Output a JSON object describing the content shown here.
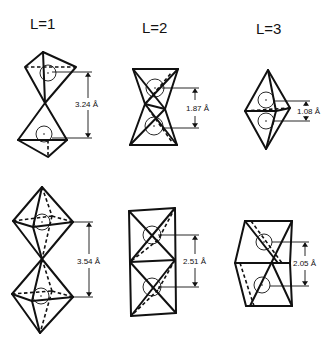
{
  "columns": [
    {
      "label": "L=1",
      "top_distance": "3.24 Å",
      "bottom_distance": "3.54 Å",
      "top_shape": "corner-sharing tetrahedra",
      "bottom_shape": "corner-sharing octahedra"
    },
    {
      "label": "L=2",
      "top_distance": "1.87 Å",
      "bottom_distance": "2.51 Å",
      "top_shape": "edge-sharing tetrahedra",
      "bottom_shape": "edge-sharing octahedra"
    },
    {
      "label": "L=3",
      "top_distance": "1.08 Å",
      "bottom_distance": "2.05 Å",
      "top_shape": "face-sharing tetrahedra",
      "bottom_shape": "face-sharing octahedra"
    }
  ],
  "colors": {
    "ink": "#111111",
    "background": "#ffffff"
  }
}
